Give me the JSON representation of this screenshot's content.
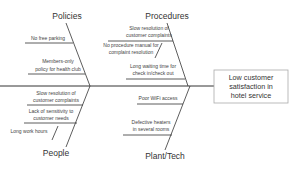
{
  "effect": {
    "lines": [
      "Low customer",
      "satisfaction in",
      "hotel service"
    ]
  },
  "categories": {
    "policies": {
      "label": "Policies",
      "causes": [
        {
          "lines": [
            "No free parking"
          ]
        },
        {
          "lines": [
            "Members-only",
            "policy for health club"
          ]
        }
      ]
    },
    "procedures": {
      "label": "Procedures",
      "causes": [
        {
          "lines": [
            "Slow resolution of",
            "customer complaints"
          ]
        },
        {
          "lines": [
            "No procedure manual for",
            "complaint resolution"
          ]
        },
        {
          "lines": [
            "Long waiting time for",
            "check in/check out"
          ]
        }
      ]
    },
    "people": {
      "label": "People",
      "causes": [
        {
          "lines": [
            "Slow resolution of",
            "customer complaints"
          ]
        },
        {
          "lines": [
            "Lack of sensitivity to",
            "customer needs"
          ]
        },
        {
          "lines": [
            "Long work hours"
          ]
        }
      ]
    },
    "plant_tech": {
      "label": "Plant/Tech",
      "causes": [
        {
          "lines": [
            "Poor WiFi access"
          ]
        },
        {
          "lines": [
            "Defective heaters",
            "in several rooms"
          ]
        }
      ]
    }
  },
  "colors": {
    "line": "#333333",
    "text": "#333333",
    "box_border": "#aaaaaa"
  }
}
